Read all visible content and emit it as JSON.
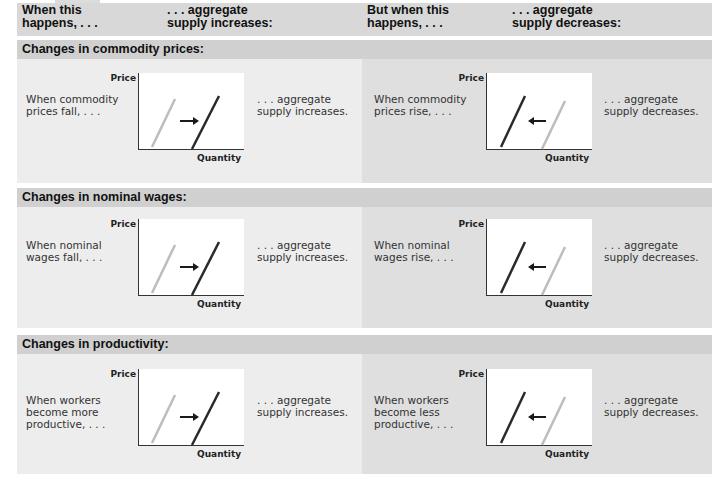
{
  "header": {
    "col1": "When this\nhappens, . . .",
    "col2": ". . . aggregate\nsupply increases:",
    "col3": "But when this\nhappens, . . .",
    "col4": ". . . aggregate\nsupply decreases:"
  },
  "axis": {
    "y_label": "Price",
    "x_label": "Quantity"
  },
  "colors": {
    "header_bg": "#d8d8d8",
    "section_bg": "#d0d0d0",
    "left_panel_bg": "#ededed",
    "right_panel_bg": "#dfdfdf",
    "new_curve": "#2a2a2a",
    "old_curve": "#bdbdbd"
  },
  "sections": [
    {
      "title": "Changes in commodity prices:",
      "left": {
        "condition": "When commodity\nprices fall, . . .",
        "result": ". . . aggregate\nsupply increases.",
        "arrow": "right-arrow"
      },
      "right": {
        "condition": "When commodity\nprices rise, . . .",
        "result": ". . . aggregate\nsupply decreases.",
        "arrow": "left-arrow"
      }
    },
    {
      "title": "Changes in nominal wages:",
      "left": {
        "condition": "When nominal\nwages fall, . . .",
        "result": ". . . aggregate\nsupply increases.",
        "arrow": "right-arrow"
      },
      "right": {
        "condition": "When nominal\nwages rise, . . .",
        "result": ". . . aggregate\nsupply decreases.",
        "arrow": "left-arrow"
      }
    },
    {
      "title": "Changes in productivity:",
      "left": {
        "condition": "When workers\nbecome more\nproductive, . . .",
        "result": ". . . aggregate\nsupply increases.",
        "arrow": "right-arrow"
      },
      "right": {
        "condition": "When workers\nbecome less\nproductive, . . .",
        "result": ". . . aggregate\nsupply decreases.",
        "arrow": "left-arrow"
      }
    }
  ]
}
